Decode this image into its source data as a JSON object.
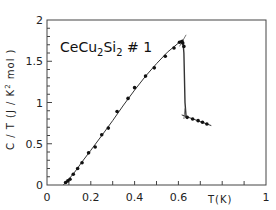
{
  "chart_data": {
    "type": "scatter",
    "title": "",
    "annotation": {
      "text_main": "CeCu",
      "sub1": "2",
      "mid": "Si",
      "sub2": "2",
      "suffix": " # 1",
      "full": "CeCu2Si2 #1"
    },
    "xlabel": "T(K)",
    "ylabel": "C / T  (J / K² mol)",
    "ylabel_parts": {
      "pre": "C / T  (J / K",
      "sup": "2",
      "post": " mol )"
    },
    "xlim": [
      0,
      1
    ],
    "ylim": [
      0,
      2
    ],
    "x_ticks": [
      0,
      0.2,
      0.4,
      0.6,
      1
    ],
    "x_tick_labels": [
      "0",
      "0.2",
      "0.4",
      "0.6",
      "1"
    ],
    "x_minor_ticks": [
      0.1,
      0.2,
      0.3,
      0.4,
      0.5,
      0.6,
      0.7,
      0.8,
      0.9
    ],
    "y_ticks": [
      0,
      0.5,
      1,
      1.5,
      2
    ],
    "y_tick_labels": [
      "0",
      "0.5",
      "1",
      "1.5",
      "2"
    ],
    "y_minor_step": 0.1,
    "grid": false,
    "legend": "none",
    "series": [
      {
        "name": "data",
        "x": [
          0.085,
          0.095,
          0.105,
          0.12,
          0.14,
          0.16,
          0.19,
          0.22,
          0.25,
          0.28,
          0.32,
          0.37,
          0.4,
          0.45,
          0.49,
          0.54,
          0.58,
          0.605,
          0.615,
          0.62,
          0.625,
          0.64,
          0.665,
          0.69,
          0.71,
          0.73
        ],
        "y": [
          0.03,
          0.05,
          0.07,
          0.13,
          0.2,
          0.27,
          0.39,
          0.46,
          0.61,
          0.69,
          0.89,
          1.05,
          1.18,
          1.32,
          1.42,
          1.56,
          1.66,
          1.73,
          1.74,
          1.72,
          1.68,
          0.82,
          0.8,
          0.78,
          0.76,
          0.74
        ]
      }
    ],
    "fit_curve": {
      "name": "fit",
      "x": [
        0.075,
        0.1,
        0.13,
        0.16,
        0.2,
        0.25,
        0.3,
        0.35,
        0.4,
        0.45,
        0.5,
        0.55,
        0.6,
        0.62
      ],
      "y": [
        0.0,
        0.07,
        0.17,
        0.28,
        0.42,
        0.6,
        0.78,
        0.97,
        1.15,
        1.32,
        1.47,
        1.61,
        1.72,
        1.76
      ]
    },
    "transition_line": {
      "x": [
        0.62,
        0.625,
        0.63,
        0.635
      ],
      "y": [
        1.76,
        1.6,
        1.0,
        0.83
      ]
    },
    "normal_state_line": {
      "x": [
        0.615,
        0.75
      ],
      "y": [
        0.85,
        0.72
      ]
    },
    "construction_marks": [
      {
        "x": [
          0.605,
          0.635
        ],
        "y": [
          1.68,
          1.82
        ]
      },
      {
        "x": [
          0.625,
          0.63
        ],
        "y": [
          0.8,
          0.93
        ]
      }
    ]
  }
}
